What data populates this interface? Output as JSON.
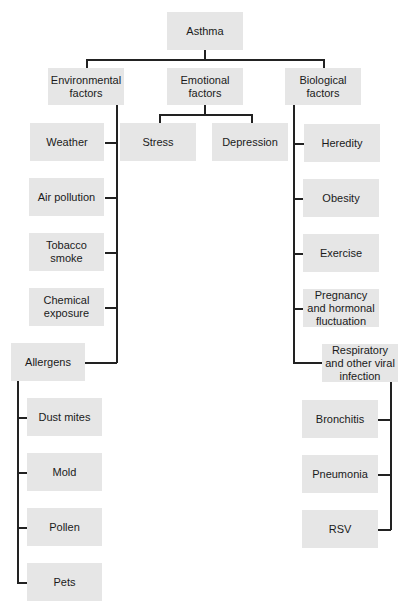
{
  "diagram": {
    "root": "Asthma",
    "categories": {
      "environmental": {
        "label": "Environmental factors",
        "items": [
          "Weather",
          "Air pollution",
          "Tobacco smoke",
          "Chemical exposure",
          "Allergens"
        ],
        "allergens": [
          "Dust mites",
          "Mold",
          "Pollen",
          "Pets"
        ]
      },
      "emotional": {
        "label": "Emotional factors",
        "items": [
          "Stress",
          "Depression"
        ]
      },
      "biological": {
        "label": "Biological factors",
        "items": [
          "Heredity",
          "Obesity",
          "Exercise",
          "Pregnancy and hormonal fluctuation",
          "Respiratory and other viral infection"
        ],
        "infections": [
          "Bronchitis",
          "Pneumonia",
          "RSV"
        ]
      }
    },
    "colors": {
      "box_fill": "#e6e6e6",
      "line": "#222222",
      "text": "#1a1a1a"
    }
  }
}
